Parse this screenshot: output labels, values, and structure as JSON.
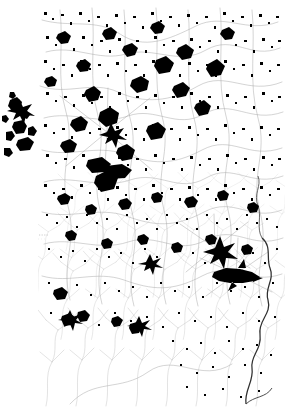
{
  "figure": {
    "kind": "map",
    "title": "",
    "caption": "",
    "width": 285,
    "height": 408,
    "background_color": "#ffffff"
  },
  "map": {
    "name": "settlement-distribution-map",
    "description": "Dense cartographic plate showing built-up settlement footprints as solid black polygons linked by a fine grey road network, with branching drainage systems in the lower third and a bold boundary line running down the right side.",
    "extent": {
      "left": 38,
      "top": 6,
      "right": 285,
      "bottom": 408
    },
    "layers": [
      {
        "id": "settlements",
        "label": "Settlement footprints",
        "color": "#000000",
        "symbol": "filled-polygon"
      },
      {
        "id": "roads",
        "label": "Road network",
        "color": "#9a9a9a",
        "symbol": "thin-line"
      },
      {
        "id": "drainage",
        "label": "Drainage / stream network",
        "color": "#b0b0b0",
        "symbol": "branching-line"
      },
      {
        "id": "boundary",
        "label": "Administrative boundary",
        "color": "#2a2a2a",
        "symbol": "bold-line"
      },
      {
        "id": "graticule",
        "label": "Latitude reference line",
        "color": "#c8c8c8",
        "symbol": "dotted-line"
      }
    ],
    "graticule": {
      "latitude_line_y": 235,
      "latitude_line_x_start": 0,
      "latitude_line_x_end": 48,
      "style": "dotted"
    },
    "density_zones": [
      {
        "id": "north-dense",
        "label": "Northern high-density settlement belt",
        "x": 38,
        "y": 6,
        "w": 247,
        "h": 200
      },
      {
        "id": "west-outlier",
        "label": "Western detached settlement cluster",
        "x": 0,
        "y": 88,
        "w": 42,
        "h": 68
      },
      {
        "id": "central-void",
        "label": "Central sparse basin",
        "x": 158,
        "y": 228,
        "w": 48,
        "h": 58
      },
      {
        "id": "south-drainage",
        "label": "Southern drainage / dendritic zone",
        "x": 38,
        "y": 300,
        "w": 247,
        "h": 108
      }
    ],
    "major_settlements": [
      {
        "id": "primate-city",
        "label": "Large elongated settlement",
        "cx": 236,
        "cy": 274,
        "size": 30
      },
      {
        "id": "secondary-city",
        "label": "Star-shaped settlement",
        "cx": 215,
        "cy": 248,
        "size": 18
      },
      {
        "id": "central-town",
        "label": "Central nodal town",
        "cx": 107,
        "cy": 132,
        "size": 14
      }
    ]
  }
}
